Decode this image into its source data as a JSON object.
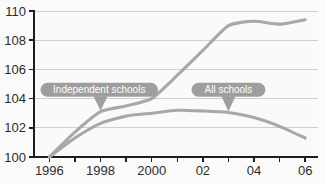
{
  "chart_data": {
    "type": "line",
    "title": "",
    "subtitle": "",
    "xlabel": "",
    "ylabel": "",
    "xlim": [
      1995.4,
      2006.5
    ],
    "ylim": [
      100,
      110
    ],
    "y_ticks": [
      100,
      102,
      104,
      106,
      108,
      110
    ],
    "y_tick_labels": [
      "100",
      "102",
      "104",
      "106",
      "108",
      "110"
    ],
    "x_ticks": [
      1996,
      1997,
      1998,
      1999,
      2000,
      2001,
      2002,
      2003,
      2004,
      2005,
      2006
    ],
    "x_tick_labels": [
      "1996",
      "",
      "1998",
      "",
      "2000",
      "",
      "02",
      "",
      "04",
      "",
      "06"
    ],
    "x_labeled_ticks": [
      {
        "x": 1996,
        "label": "1996"
      },
      {
        "x": 1998,
        "label": "1998"
      },
      {
        "x": 2000,
        "label": "2000"
      },
      {
        "x": 2002,
        "label": "02"
      },
      {
        "x": 2004,
        "label": "04"
      },
      {
        "x": 2006,
        "label": "06"
      }
    ],
    "grid": true,
    "grid_axis": "y",
    "legend": "annotations",
    "legend_position": "inline-callouts",
    "line_color": "#a8a8a8",
    "grid_color": "#cfcfcf",
    "axis_color": "#1d1d1d",
    "background_color": "#fafafa",
    "callout_color": "#9e9e9e",
    "callout_text_color": "#ffffff",
    "x": [
      1996,
      1997,
      1998,
      1999,
      2000,
      2001,
      2002,
      2003,
      2004,
      2005,
      2006
    ],
    "series": [
      {
        "name": "Independent schools",
        "values": [
          100.0,
          101.7,
          103.1,
          103.5,
          104.0,
          105.6,
          107.3,
          109.0,
          109.3,
          109.1,
          109.4
        ]
      },
      {
        "name": "All schools",
        "values": [
          100.0,
          101.3,
          102.3,
          102.8,
          103.0,
          103.2,
          103.15,
          103.05,
          102.7,
          102.1,
          101.3
        ]
      }
    ],
    "annotations": [
      {
        "label": "Independent schools",
        "target_x": 1998,
        "target_y": 103.1,
        "bubble_x": 1997.95,
        "bubble_y": 104.6
      },
      {
        "label": "All schools",
        "target_x": 2003,
        "target_y": 103.05,
        "bubble_x": 2003.0,
        "bubble_y": 104.6
      }
    ]
  }
}
